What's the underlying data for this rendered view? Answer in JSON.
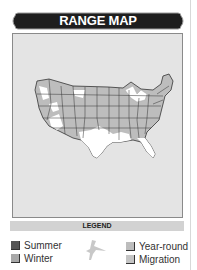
{
  "banner": {
    "title": "RANGE MAP"
  },
  "map": {
    "region": "Contiguous United States",
    "colors": {
      "background": "#e4e4e4",
      "land_gray": "#bdbdbd",
      "land_light": "#ffffff",
      "state_border": "#333333"
    }
  },
  "legend": {
    "title": "LEGEND",
    "items": [
      {
        "label": "Summer",
        "color": "#555555"
      },
      {
        "label": "Winter",
        "color": "#a8a8a8"
      },
      {
        "label": "Year-round",
        "color": "#bdbdbd"
      },
      {
        "label": "Migration",
        "color": "#c4c4c4"
      }
    ],
    "icon": "bird-silhouette-icon"
  }
}
